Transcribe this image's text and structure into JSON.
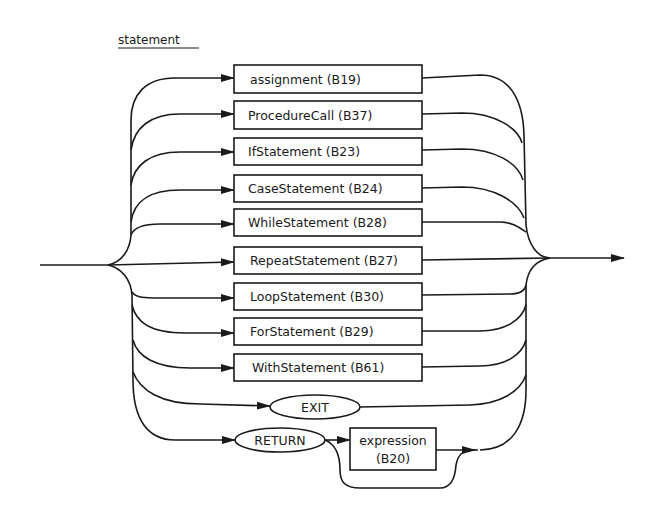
{
  "diagram": {
    "title": "statement",
    "type": "syntax-diagram",
    "alternatives": [
      {
        "label": "assignment (B19)",
        "kind": "nonterminal"
      },
      {
        "label": "ProcedureCall (B37)",
        "kind": "nonterminal"
      },
      {
        "label": "IfStatement (B23)",
        "kind": "nonterminal"
      },
      {
        "label": "CaseStatement (B24)",
        "kind": "nonterminal"
      },
      {
        "label": "WhileStatement (B28)",
        "kind": "nonterminal"
      },
      {
        "label": "RepeatStatement (B27)",
        "kind": "nonterminal"
      },
      {
        "label": "LoopStatement (B30)",
        "kind": "nonterminal"
      },
      {
        "label": "ForStatement (B29)",
        "kind": "nonterminal"
      },
      {
        "label": "WithStatement (B61)",
        "kind": "nonterminal"
      },
      {
        "label": "",
        "kind": "empty"
      },
      {
        "label": "EXIT",
        "kind": "terminal"
      },
      {
        "label": "RETURN",
        "kind": "terminal"
      }
    ],
    "return_optional": {
      "line1": "expression",
      "line2": "(B20)",
      "kind": "nonterminal",
      "optional": true
    },
    "colors": {
      "ink": "#1a1a1a",
      "background": "#ffffff"
    }
  }
}
